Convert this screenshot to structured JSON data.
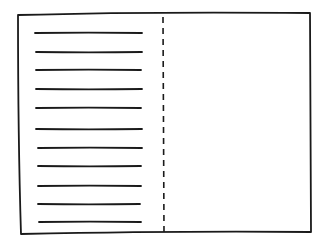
{
  "diagram": {
    "type": "wireframe-sketch",
    "colors": {
      "stroke": "#1a1a1a",
      "background": "#ffffff"
    },
    "frame": {
      "x1": 18,
      "y1": 15,
      "x2": 310,
      "y2": 232
    },
    "divider": {
      "x": 163,
      "y1": 16,
      "y2": 232,
      "style": "dashed"
    },
    "text_lines": [
      {
        "x1": 35,
        "x2": 142,
        "y": 33
      },
      {
        "x1": 36,
        "x2": 142,
        "y": 52
      },
      {
        "x1": 36,
        "x2": 141,
        "y": 70
      },
      {
        "x1": 36,
        "x2": 142,
        "y": 89
      },
      {
        "x1": 36,
        "x2": 141,
        "y": 108
      },
      {
        "x1": 36,
        "x2": 142,
        "y": 129
      },
      {
        "x1": 38,
        "x2": 142,
        "y": 148
      },
      {
        "x1": 38,
        "x2": 141,
        "y": 166
      },
      {
        "x1": 38,
        "x2": 141,
        "y": 186
      },
      {
        "x1": 38,
        "x2": 140,
        "y": 204
      },
      {
        "x1": 39,
        "x2": 141,
        "y": 222
      }
    ],
    "right_panel": {
      "content": ""
    }
  }
}
